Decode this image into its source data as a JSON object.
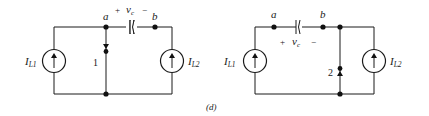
{
  "figure_label": "(d)",
  "circuits": [
    {
      "id": "left",
      "nodes": {
        "a": "a",
        "b": "b"
      },
      "capacitor": {
        "plus": "+",
        "name": "v",
        "sub": "c",
        "minus": "−"
      },
      "sources": [
        {
          "name": "I",
          "sub": "L1"
        },
        {
          "name": "I",
          "sub": "L2"
        }
      ],
      "switch_label": "1"
    },
    {
      "id": "right",
      "nodes": {
        "a": "a",
        "b": "b"
      },
      "capacitor": {
        "plus": "+",
        "name": "v",
        "sub": "c",
        "minus": "−"
      },
      "sources": [
        {
          "name": "I",
          "sub": "L1"
        },
        {
          "name": "I",
          "sub": "L2"
        }
      ],
      "switch_label": "2"
    }
  ]
}
